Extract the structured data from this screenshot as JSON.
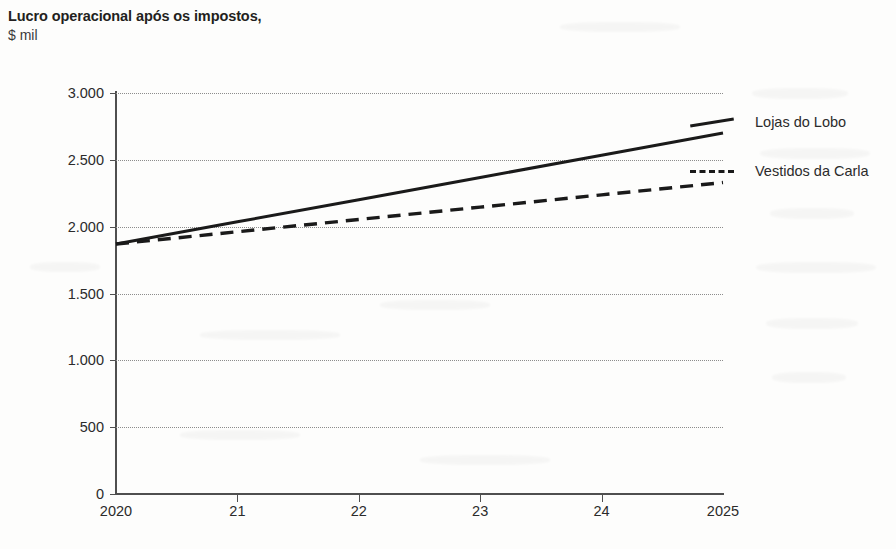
{
  "chart_data": {
    "type": "line",
    "title": "Lucro operacional após os impostos,",
    "subtitle": "$ mil",
    "xlabel": "",
    "ylabel": "",
    "x": [
      2020,
      2021,
      2022,
      2023,
      2024,
      2025
    ],
    "x_tick_labels": [
      "2020",
      "21",
      "22",
      "23",
      "24",
      "2025"
    ],
    "y_tick_labels": [
      "0",
      "500",
      "1.000",
      "1.500",
      "2.000",
      "2.500",
      "3.000"
    ],
    "y_tick_values": [
      0,
      500,
      1000,
      1500,
      2000,
      2500,
      3000
    ],
    "ylim": [
      0,
      3000
    ],
    "xlim": [
      2020,
      2025
    ],
    "grid": "horizontal-dotted",
    "legend_position": "right",
    "series": [
      {
        "name": "Lojas do Lobo",
        "style": "solid",
        "color": "#1a1a1a",
        "values": [
          1870,
          2036,
          2202,
          2368,
          2534,
          2700
        ]
      },
      {
        "name": "Vestidos da Carla",
        "style": "dashed",
        "color": "#1a1a1a",
        "values": [
          1870,
          1962,
          2054,
          2146,
          2238,
          2330
        ]
      }
    ]
  },
  "legend": {
    "items": [
      {
        "label": "Lojas do Lobo",
        "style": "solid"
      },
      {
        "label": "Vestidos da Carla",
        "style": "dashed"
      }
    ]
  },
  "caption": {
    "text": ""
  }
}
